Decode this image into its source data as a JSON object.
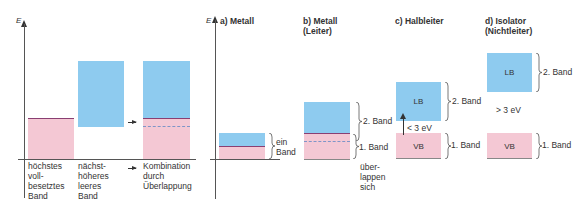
{
  "left_panel": {
    "axis_label": "E",
    "labels": {
      "band1": "höchstes\nvoll-\nbesetztes\nBand",
      "band2": "nächst-\nhöheres\nleeres\nBand",
      "combo": "Kombination\ndurch\nÜberlappung"
    }
  },
  "right_panel": {
    "axis_label": "E",
    "a": {
      "title": "a) Metall",
      "brace_label": "ein\nBand"
    },
    "b": {
      "title": "b) Metall\n    (Leiter)",
      "upper_brace": "2. Band",
      "lower_brace": "1. Band",
      "note": "über-\nlappen\nsich"
    },
    "c": {
      "title": "c) Halbleiter",
      "lb": "LB",
      "vb": "VB",
      "gap": "< 3 eV",
      "upper_brace": "2. Band",
      "lower_brace": "1. Band"
    },
    "d": {
      "title": "d) Isolator\n    (Nichtleiter)",
      "lb": "LB",
      "vb": "VB",
      "gap": "> 3 eV",
      "upper_brace": "2. Band",
      "lower_brace": "1. Band"
    }
  },
  "colors": {
    "valence": "#f4c8d4",
    "conduction": "#8ecbef",
    "fermi_line": "#8a3f72",
    "dashed": "#7f95c8"
  }
}
